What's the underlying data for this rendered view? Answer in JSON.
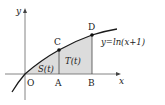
{
  "figure": {
    "axes": {
      "x_label": "x",
      "y_label": "y",
      "origin_label": "O"
    },
    "points": {
      "A": "A",
      "B": "B",
      "C": "C",
      "D": "D"
    },
    "curve": {
      "equation": "y=ln(x+1)"
    },
    "regions": {
      "S": "S(t)",
      "T": "T(t)"
    },
    "colors": {
      "line": "#1a1a1a",
      "shade": "#dcdcdc",
      "axis": "#555555"
    }
  }
}
